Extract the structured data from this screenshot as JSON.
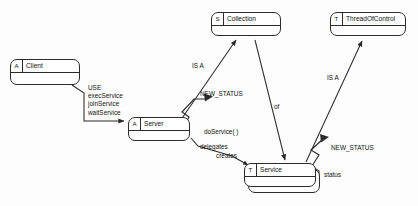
{
  "diagram": {
    "background": "#fdfdfd",
    "line_color": "#2b2b2b",
    "text_color": "#111111",
    "classes": [
      {
        "id": "client",
        "stereotype": "A",
        "name": "Client",
        "x": 10,
        "y": 59,
        "w": 70,
        "h": 26
      },
      {
        "id": "server",
        "stereotype": "A",
        "name": "Server",
        "x": 128,
        "y": 117,
        "w": 62,
        "h": 24
      },
      {
        "id": "collection",
        "stereotype": "S",
        "name": "Collection",
        "x": 211,
        "y": 12,
        "w": 70,
        "h": 24
      },
      {
        "id": "threadofcontrol",
        "stereotype": "T",
        "name": "ThreadOfControl",
        "x": 330,
        "y": 12,
        "w": 76,
        "h": 24
      },
      {
        "id": "service",
        "stereotype": "T",
        "name": "Service",
        "x": 244,
        "y": 163,
        "w": 72,
        "h": 24
      }
    ],
    "edge_labels": [
      {
        "id": "use-block",
        "text": "USE\nexecService\njoinService\nwaitService",
        "x": 88,
        "y": 84
      },
      {
        "id": "is-a-left",
        "text": "IS A",
        "x": 192,
        "y": 62
      },
      {
        "id": "new-status-left",
        "text": "NEW_STATUS",
        "x": 200,
        "y": 90
      },
      {
        "id": "of",
        "text": "of",
        "x": 274,
        "y": 103
      },
      {
        "id": "do-service",
        "text": "doService( )",
        "x": 204,
        "y": 128
      },
      {
        "id": "delegates",
        "text": "delegates",
        "x": 200,
        "y": 143
      },
      {
        "id": "creates",
        "text": "creates",
        "x": 216,
        "y": 152
      },
      {
        "id": "is-a-right",
        "text": "IS A",
        "x": 327,
        "y": 74
      },
      {
        "id": "new-status-right",
        "text": "NEW_STATUS",
        "x": 331,
        "y": 144
      },
      {
        "id": "status",
        "text": "status",
        "x": 324,
        "y": 171
      }
    ]
  }
}
